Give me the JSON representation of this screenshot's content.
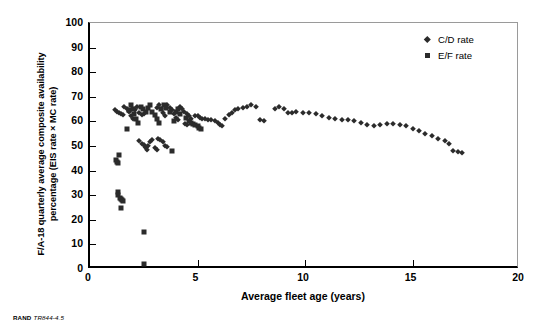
{
  "caption": {
    "publisher": "RAND",
    "figure_id": "TR844-4.5"
  },
  "chart_data": {
    "type": "scatter",
    "title": "",
    "xlabel": "Average fleet age (years)",
    "ylabel": "F/A-18 quarterly average composite availability percentage (EIS rate × MC rate)",
    "ylabel_line1": "F/A-18 quarterly average composite availability",
    "ylabel_line2": "percentage (EIS rate × MC rate)",
    "xlim": [
      0,
      20
    ],
    "ylim": [
      0,
      100
    ],
    "xticks": [
      0,
      5,
      10,
      15,
      20
    ],
    "yticks": [
      0,
      10,
      20,
      30,
      40,
      50,
      60,
      70,
      80,
      90,
      100
    ],
    "grid": false,
    "legend_position": "top-right",
    "series": [
      {
        "name": "C/D rate",
        "marker": "diamond",
        "color": "#2b2b2b",
        "points": [
          [
            1.15,
            64.5
          ],
          [
            1.25,
            64.0
          ],
          [
            1.35,
            63.5
          ],
          [
            1.45,
            63.0
          ],
          [
            1.55,
            62.5
          ],
          [
            1.6,
            66.0
          ],
          [
            1.7,
            65.0
          ],
          [
            1.8,
            64.0
          ],
          [
            1.9,
            62.0
          ],
          [
            2.0,
            61.0
          ],
          [
            2.1,
            64.5
          ],
          [
            2.2,
            66.0
          ],
          [
            2.3,
            63.5
          ],
          [
            2.4,
            62.5
          ],
          [
            2.5,
            63.0
          ],
          [
            2.3,
            52.0
          ],
          [
            2.4,
            51.0
          ],
          [
            2.5,
            50.5
          ],
          [
            2.55,
            49.5
          ],
          [
            2.6,
            49.0
          ],
          [
            2.65,
            48.5
          ],
          [
            2.7,
            50.0
          ],
          [
            2.8,
            51.5
          ],
          [
            2.9,
            52.5
          ],
          [
            3.0,
            49.0
          ],
          [
            3.1,
            48.5
          ],
          [
            3.15,
            53.0
          ],
          [
            3.25,
            52.5
          ],
          [
            3.4,
            51.5
          ],
          [
            3.5,
            50.0
          ],
          [
            3.6,
            49.5
          ],
          [
            3.1,
            65.5
          ],
          [
            3.2,
            66.5
          ],
          [
            3.3,
            65.0
          ],
          [
            3.4,
            63.5
          ],
          [
            3.5,
            62.0
          ],
          [
            3.6,
            66.5
          ],
          [
            3.7,
            65.5
          ],
          [
            3.8,
            64.5
          ],
          [
            3.9,
            63.0
          ],
          [
            4.0,
            61.5
          ],
          [
            4.1,
            60.5
          ],
          [
            4.2,
            66.0
          ],
          [
            4.3,
            65.0
          ],
          [
            4.35,
            64.0
          ],
          [
            4.5,
            63.0
          ],
          [
            4.6,
            62.0
          ],
          [
            4.7,
            61.0
          ],
          [
            4.4,
            59.0
          ],
          [
            4.5,
            58.5
          ],
          [
            4.9,
            62.0
          ],
          [
            5.0,
            62.0
          ],
          [
            5.1,
            61.5
          ],
          [
            5.2,
            61.0
          ],
          [
            5.35,
            61.0
          ],
          [
            5.5,
            60.5
          ],
          [
            5.65,
            60.5
          ],
          [
            5.8,
            60.0
          ],
          [
            5.95,
            59.5
          ],
          [
            6.05,
            58.5
          ],
          [
            6.15,
            58.0
          ],
          [
            6.3,
            61.0
          ],
          [
            6.45,
            62.5
          ],
          [
            6.6,
            63.5
          ],
          [
            6.75,
            64.5
          ],
          [
            6.9,
            65.0
          ],
          [
            7.1,
            65.5
          ],
          [
            7.3,
            66.0
          ],
          [
            7.5,
            66.5
          ],
          [
            7.7,
            66.0
          ],
          [
            7.9,
            60.5
          ],
          [
            8.1,
            60.0
          ],
          [
            8.6,
            65.0
          ],
          [
            8.8,
            66.0
          ],
          [
            9.0,
            65.0
          ],
          [
            9.2,
            63.5
          ],
          [
            9.4,
            63.5
          ],
          [
            9.6,
            64.0
          ],
          [
            9.9,
            63.5
          ],
          [
            10.2,
            63.5
          ],
          [
            10.5,
            63.0
          ],
          [
            10.8,
            62.0
          ],
          [
            11.1,
            61.5
          ],
          [
            11.4,
            61.0
          ],
          [
            11.7,
            60.5
          ],
          [
            12.0,
            60.5
          ],
          [
            12.3,
            60.0
          ],
          [
            12.6,
            59.5
          ],
          [
            12.9,
            58.5
          ],
          [
            13.2,
            58.0
          ],
          [
            13.5,
            58.5
          ],
          [
            13.8,
            59.0
          ],
          [
            14.1,
            59.0
          ],
          [
            14.4,
            58.5
          ],
          [
            14.7,
            58.0
          ],
          [
            15.0,
            57.0
          ],
          [
            15.3,
            56.0
          ],
          [
            15.6,
            55.0
          ],
          [
            15.9,
            54.0
          ],
          [
            16.2,
            53.0
          ],
          [
            16.5,
            52.0
          ],
          [
            16.7,
            51.0
          ],
          [
            16.9,
            48.0
          ],
          [
            17.1,
            47.5
          ],
          [
            17.3,
            47.0
          ]
        ]
      },
      {
        "name": "E/F rate",
        "marker": "square",
        "color": "#2b2b2b",
        "points": [
          [
            1.3,
            31.5
          ],
          [
            1.32,
            30.0
          ],
          [
            1.4,
            29.0
          ],
          [
            1.45,
            28.5
          ],
          [
            1.5,
            28.0
          ],
          [
            1.55,
            27.5
          ],
          [
            1.45,
            25.0
          ],
          [
            1.2,
            44.5
          ],
          [
            1.25,
            43.5
          ],
          [
            1.3,
            43.0
          ],
          [
            1.35,
            46.5
          ],
          [
            1.7,
            57.0
          ],
          [
            1.8,
            64.5
          ],
          [
            1.9,
            66.5
          ],
          [
            2.0,
            65.0
          ],
          [
            2.05,
            63.0
          ],
          [
            2.15,
            61.0
          ],
          [
            2.25,
            59.5
          ],
          [
            2.35,
            66.0
          ],
          [
            2.45,
            65.0
          ],
          [
            2.5,
            15.0
          ],
          [
            2.5,
            2.0
          ],
          [
            2.6,
            64.0
          ],
          [
            2.7,
            65.5
          ],
          [
            2.8,
            66.5
          ],
          [
            2.9,
            64.0
          ],
          [
            3.0,
            62.5
          ],
          [
            3.1,
            61.0
          ],
          [
            3.2,
            59.5
          ],
          [
            3.3,
            65.0
          ],
          [
            3.45,
            66.5
          ],
          [
            3.55,
            65.5
          ],
          [
            3.7,
            64.0
          ],
          [
            3.8,
            48.0
          ],
          [
            3.9,
            60.0
          ],
          [
            4.0,
            64.0
          ],
          [
            4.1,
            65.0
          ],
          [
            4.2,
            63.0
          ],
          [
            4.45,
            61.5
          ],
          [
            4.6,
            60.0
          ],
          [
            4.7,
            59.5
          ],
          [
            4.8,
            59.0
          ],
          [
            4.9,
            58.5
          ],
          [
            5.0,
            58.0
          ],
          [
            5.05,
            57.5
          ],
          [
            5.15,
            57.0
          ]
        ]
      }
    ]
  },
  "legend": {
    "items": [
      {
        "label": "C/D rate",
        "marker": "diamond"
      },
      {
        "label": "E/F rate",
        "marker": "square"
      }
    ]
  }
}
